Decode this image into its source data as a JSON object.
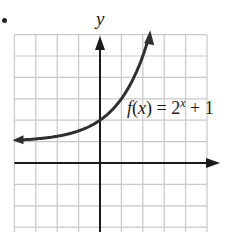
{
  "bullet": "•",
  "colors": {
    "grid": "#c8c8c8",
    "axis": "#1a1a1a",
    "curve": "#2f2f2f",
    "text": "#1a1a1a"
  },
  "chart_data": {
    "type": "line",
    "title": "",
    "xlabel": "",
    "ylabel": "y",
    "function_label": "f(x) = 2^x + 1",
    "function_label_parts": {
      "prefix": "f(x) = 2",
      "exponent": "x",
      "suffix": " + 1"
    },
    "grid": true,
    "xlim": [
      -4,
      5
    ],
    "ylim": [
      -3,
      6
    ],
    "asymptote_y": 1,
    "series": [
      {
        "name": "f(x) = 2^x + 1",
        "x": [
          -3.9,
          -3,
          -2,
          -1,
          0,
          1,
          1.5,
          2,
          2.25
        ],
        "y": [
          1.07,
          1.125,
          1.25,
          1.5,
          2,
          3,
          3.83,
          5,
          5.76
        ]
      }
    ],
    "arrows": {
      "curve_left": true,
      "curve_right": true,
      "x_axis_positive": true,
      "y_axis_positive": true
    }
  }
}
